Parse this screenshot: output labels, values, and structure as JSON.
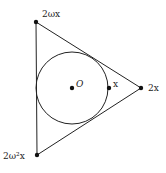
{
  "diagram": {
    "title": "",
    "colors": {
      "stroke": "#222222",
      "background": "#ffffff"
    },
    "triangle": {
      "vertices": [
        {
          "id": "top",
          "label": "2ωx",
          "x": 36,
          "y": 22
        },
        {
          "id": "right",
          "label": "2x",
          "x": 141,
          "y": 88
        },
        {
          "id": "bottom",
          "label": "2ω²x",
          "x": 37,
          "y": 155
        }
      ]
    },
    "incircle": {
      "cx": 72,
      "cy": 88,
      "r": 36
    },
    "points": [
      {
        "id": "center",
        "label": "O",
        "x": 72,
        "y": 88
      },
      {
        "id": "x",
        "label": "x",
        "x": 109,
        "y": 88
      }
    ]
  }
}
